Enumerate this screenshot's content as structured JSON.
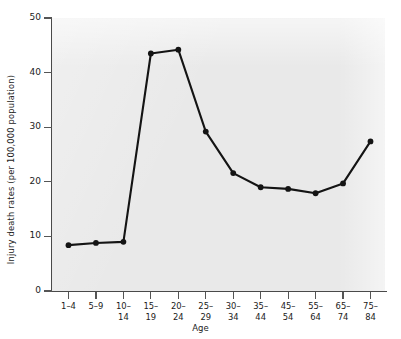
{
  "chart_data": {
    "type": "line",
    "title": "",
    "xlabel": "Age",
    "ylabel": "Injury death rates (per 100,000 population)",
    "categories": [
      "1–4",
      "5–9",
      "10–14",
      "15–19",
      "20–24",
      "25–29",
      "30–34",
      "35–44",
      "45–54",
      "55–64",
      "65–74",
      "75–84"
    ],
    "values": [
      8.4,
      8.8,
      9.0,
      43.5,
      44.2,
      29.2,
      21.6,
      19.0,
      18.7,
      17.9,
      19.7,
      27.4
    ],
    "series": [
      {
        "name": "Injury death rate",
        "values": [
          8.4,
          8.8,
          9.0,
          43.5,
          44.2,
          29.2,
          21.6,
          19.0,
          18.7,
          17.9,
          19.7,
          27.4
        ]
      }
    ],
    "ylim": [
      0,
      50
    ],
    "yticks": [
      0,
      10,
      20,
      30,
      40,
      50
    ],
    "ytick_labels": [
      "0",
      "10",
      "20",
      "30",
      "40",
      "50"
    ],
    "grid": false,
    "legend": "none",
    "marker": "filled-circle",
    "line_color": "#141414",
    "marker_color": "#141414",
    "panel_color": "#e9e9e9",
    "axis_color": "#4a4a4a"
  },
  "axis": {
    "y_title": "Injury death rates (per 100,000 population)",
    "x_title": "Age"
  }
}
